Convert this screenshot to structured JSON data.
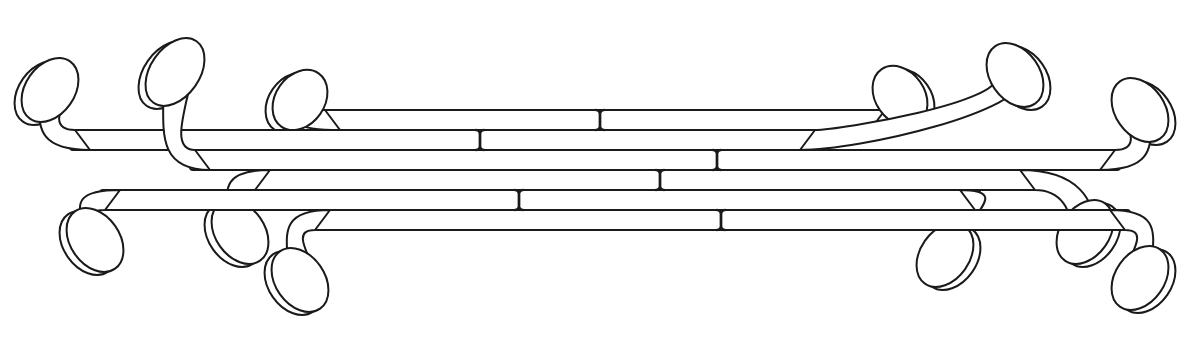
{
  "figure": {
    "kind": "line-drawing",
    "background": "#ffffff",
    "stroke_color": "#1a1a1a",
    "width": 1203,
    "height": 337
  },
  "rows_y": [
    110,
    130,
    150,
    170,
    190,
    210,
    230
  ],
  "strips": [
    {
      "name": "strip-top-1",
      "y_top": 110,
      "y_bottom": 130,
      "x_left": 280,
      "x_right": 930,
      "left_end": "up",
      "right_end": "up",
      "left_paddle": {
        "cx": 300,
        "cy": 100,
        "rx": 30,
        "ry": 26
      },
      "right_paddle": {
        "cx": 900,
        "cy": 96,
        "rx": 30,
        "ry": 26
      }
    },
    {
      "name": "strip-top-2",
      "y_top": 130,
      "y_bottom": 150,
      "x_left": 30,
      "x_right": 860,
      "left_end": "up",
      "right_end": "up",
      "left_paddle": {
        "cx": 50,
        "cy": 90,
        "rx": 30,
        "ry": 28
      },
      "right_paddle": {
        "cx": 1015,
        "cy": 75,
        "rx": 30,
        "ry": 28
      }
    },
    {
      "name": "strip-top-3",
      "y_top": 150,
      "y_bottom": 170,
      "x_left": 150,
      "x_right": 1160,
      "left_end": "up",
      "right_end": "up",
      "left_paddle": {
        "cx": 175,
        "cy": 72,
        "rx": 30,
        "ry": 30
      },
      "right_paddle": {
        "cx": 1140,
        "cy": 110,
        "rx": 30,
        "ry": 28
      }
    },
    {
      "name": "strip-bottom-1",
      "y_top": 170,
      "y_bottom": 190,
      "x_left": 210,
      "x_right": 1080,
      "left_end": "down",
      "right_end": "down",
      "left_paddle": {
        "cx": 240,
        "cy": 232,
        "rx": 30,
        "ry": 28
      },
      "right_paddle": {
        "cx": 1085,
        "cy": 232,
        "rx": 30,
        "ry": 28
      }
    },
    {
      "name": "strip-bottom-2",
      "y_top": 190,
      "y_bottom": 210,
      "x_left": 60,
      "x_right": 1020,
      "left_end": "down",
      "right_end": "down",
      "left_paddle": {
        "cx": 95,
        "cy": 240,
        "rx": 30,
        "ry": 28
      },
      "right_paddle": {
        "cx": 945,
        "cy": 255,
        "rx": 30,
        "ry": 28
      }
    },
    {
      "name": "strip-bottom-3",
      "y_top": 210,
      "y_bottom": 230,
      "x_left": 270,
      "x_right": 1170,
      "left_end": "down",
      "right_end": "down",
      "left_paddle": {
        "cx": 300,
        "cy": 280,
        "rx": 30,
        "ry": 28
      },
      "right_paddle": {
        "cx": 1140,
        "cy": 278,
        "rx": 30,
        "ry": 28
      }
    }
  ],
  "joints": [
    {
      "x": 600,
      "y1": 110,
      "y2": 130
    },
    {
      "x": 480,
      "y1": 130,
      "y2": 150
    },
    {
      "x": 717,
      "y1": 150,
      "y2": 170
    },
    {
      "x": 660,
      "y1": 170,
      "y2": 190
    },
    {
      "x": 519,
      "y1": 190,
      "y2": 210
    },
    {
      "x": 721,
      "y1": 210,
      "y2": 230
    }
  ]
}
